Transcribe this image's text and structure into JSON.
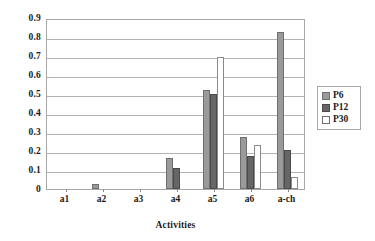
{
  "chart_data": {
    "type": "bar",
    "title": "",
    "xlabel": "Activities",
    "ylabel": "",
    "categories": [
      "a1",
      "a2",
      "a3",
      "a4",
      "a5",
      "a6",
      "a-ch"
    ],
    "series": [
      {
        "name": "P6",
        "color": "#9a9a9a",
        "values": [
          0.0,
          0.025,
          0.0,
          0.165,
          0.52,
          0.275,
          0.825
        ]
      },
      {
        "name": "P12",
        "color": "#666666",
        "values": [
          0.0,
          0.0,
          0.0,
          0.11,
          0.5,
          0.175,
          0.205
        ]
      },
      {
        "name": "P30",
        "color": "#ffffff",
        "values": [
          0.0,
          0.0,
          0.0,
          0.0,
          0.695,
          0.23,
          0.065
        ]
      }
    ],
    "ylim": [
      0,
      0.9
    ],
    "ytick_labels": [
      "0.9",
      "0.8",
      "0.7",
      "0.6",
      "0.5",
      "0.4",
      "0.3",
      "0.2",
      "0.1",
      "0"
    ],
    "ytick_values": [
      0.9,
      0.8,
      0.7,
      0.6,
      0.5,
      0.4,
      0.3,
      0.2,
      0.1,
      0
    ],
    "grid": true,
    "legend_position": "right",
    "legend_entries": [
      "P6",
      "P12",
      "P30"
    ]
  }
}
